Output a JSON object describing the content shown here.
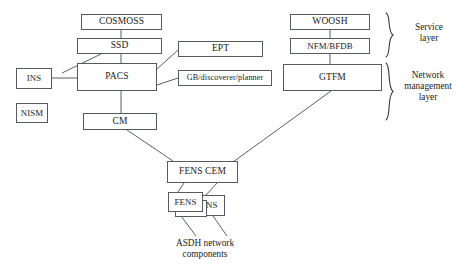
{
  "diagram": {
    "background_color": "#ffffff",
    "box_border_color": "#555a5e",
    "line_color": "#5a5f63",
    "text_color": "#1a1a1a",
    "nodes": [
      {
        "id": "cosmoss",
        "label": "COSMOSS",
        "x": 81,
        "y": 14,
        "w": 81,
        "h": 16
      },
      {
        "id": "ssd",
        "label": "SSD",
        "x": 77,
        "y": 38,
        "w": 85,
        "h": 16
      },
      {
        "id": "pacs",
        "label": "PACS",
        "x": 77,
        "y": 63,
        "w": 80,
        "h": 28
      },
      {
        "id": "ins",
        "label": "INS",
        "x": 16,
        "y": 68,
        "w": 36,
        "h": 21
      },
      {
        "id": "nism",
        "label": "NISM",
        "x": 16,
        "y": 103,
        "w": 32,
        "h": 20
      },
      {
        "id": "cm",
        "label": "CM",
        "x": 83,
        "y": 113,
        "w": 74,
        "h": 17
      },
      {
        "id": "ept",
        "label": "EPT",
        "x": 178,
        "y": 41,
        "w": 85,
        "h": 16
      },
      {
        "id": "gb",
        "label": "GB/discoverer/planner",
        "x": 178,
        "y": 70,
        "w": 94,
        "h": 16
      },
      {
        "id": "woosh",
        "label": "WOOSH",
        "x": 290,
        "y": 14,
        "w": 80,
        "h": 16
      },
      {
        "id": "nfmbfdb",
        "label": "NFM/BFDB",
        "x": 290,
        "y": 38,
        "w": 80,
        "h": 16
      },
      {
        "id": "gtfm",
        "label": "GTFM",
        "x": 283,
        "y": 64,
        "w": 99,
        "h": 27
      },
      {
        "id": "fenscem",
        "label": "FENS CEM",
        "x": 167,
        "y": 161,
        "w": 71,
        "h": 22
      },
      {
        "id": "ens",
        "label": "ENS",
        "x": 193,
        "y": 195,
        "w": 32,
        "h": 21
      },
      {
        "id": "fens_back",
        "label": "",
        "x": 175,
        "y": 200,
        "w": 32,
        "h": 17
      },
      {
        "id": "fens",
        "label": "FENS",
        "x": 168,
        "y": 192,
        "w": 35,
        "h": 20
      }
    ],
    "edges": [
      {
        "from": "cosmoss",
        "to": "ssd",
        "points": "121,30 121,38"
      },
      {
        "from": "ssd",
        "to": "pacs",
        "points": "121,54 121,63"
      },
      {
        "from": "ssd",
        "to": "ins",
        "points": "101,54 66,74"
      },
      {
        "from": "ins",
        "to": "pacs",
        "points": "52,78 77,78"
      },
      {
        "from": "pacs",
        "to": "ept",
        "points": "157,68 178,50"
      },
      {
        "from": "pacs",
        "to": "gb",
        "points": "157,84 178,78"
      },
      {
        "from": "pacs",
        "to": "cm",
        "points": "121,91 121,113"
      },
      {
        "from": "woosh",
        "to": "nfmbfdb",
        "points": "330,30 330,38"
      },
      {
        "from": "nfmbfdb",
        "to": "gtfm",
        "points": "330,54 330,64"
      },
      {
        "from": "cm",
        "to": "fenscem",
        "points": "127,130 172,161"
      },
      {
        "from": "gtfm",
        "to": "fenscem",
        "points": "331,91 231,162"
      },
      {
        "from": "fenscem",
        "to": "fens",
        "points": "183,183 177,192"
      },
      {
        "from": "fenscem",
        "to": "ens",
        "points": "216,183 205,195"
      },
      {
        "from": "fens",
        "to": "asdh",
        "points": "178,212 196,236"
      },
      {
        "from": "ens",
        "to": "asdh",
        "points": "213,216 226,236"
      }
    ],
    "braces": [
      {
        "id": "service-layer-brace",
        "x": 384,
        "y": 12,
        "w": 12,
        "h": 45
      },
      {
        "id": "network-mgmt-brace",
        "x": 384,
        "y": 62,
        "w": 12,
        "h": 58
      }
    ],
    "captions": [
      {
        "id": "service-layer-label",
        "text": "Service\nlayer",
        "x": 400,
        "y": 22,
        "w": 58
      },
      {
        "id": "network-mgmt-label",
        "text": "Network\nmanagement\nlayer",
        "x": 398,
        "y": 71,
        "w": 60
      },
      {
        "id": "asdh-label",
        "text": "ASDH network\ncomponents",
        "x": 150,
        "y": 238,
        "w": 110
      }
    ]
  }
}
